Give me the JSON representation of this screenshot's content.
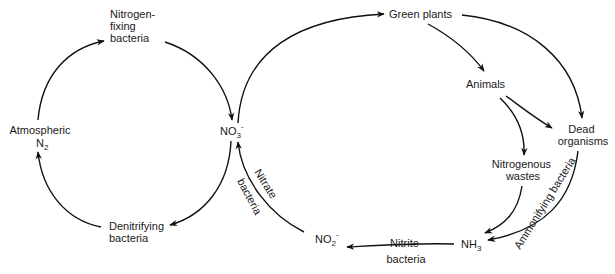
{
  "diagram": {
    "type": "nitrogen-cycle",
    "nodes": {
      "nitrogen_fixing": [
        "Nitrogen-",
        "fixing",
        "bacteria"
      ],
      "atmospheric_n2": {
        "line1": "Atmospheric",
        "line2_main": "N",
        "line2_sub": "2"
      },
      "denitrifying": [
        "Denitrifying",
        "bacteria"
      ],
      "nitrate": {
        "main": "NO",
        "sub": "3",
        "sup": "-"
      },
      "green_plants": "Green plants",
      "animals": "Animals",
      "dead_organisms": [
        "Dead",
        "organisms"
      ],
      "nitrogenous_wastes": [
        "Nitrogenous",
        "wastes"
      ],
      "ammonia": {
        "main": "NH",
        "sub": "3"
      },
      "nitrite": {
        "main": "NO",
        "sub": "2",
        "sup": "-"
      }
    },
    "edge_labels": {
      "nitrate_bacteria": [
        "Nitrate",
        "bacteria"
      ],
      "nitrite_bacteria": [
        "Nitrite",
        "bacteria"
      ],
      "ammonifying_bacteria": "Ammonifying bacteria"
    },
    "edges": [
      {
        "from": "Atmospheric N2",
        "to": "Nitrogen-fixing bacteria"
      },
      {
        "from": "Nitrogen-fixing bacteria",
        "to": "NO3-"
      },
      {
        "from": "NO3-",
        "to": "Denitrifying bacteria"
      },
      {
        "from": "Denitrifying bacteria",
        "to": "Atmospheric N2"
      },
      {
        "from": "NO3-",
        "to": "Green plants"
      },
      {
        "from": "Green plants",
        "to": "Animals"
      },
      {
        "from": "Green plants",
        "to": "Dead organisms"
      },
      {
        "from": "Animals",
        "to": "Dead organisms"
      },
      {
        "from": "Animals",
        "to": "Nitrogenous wastes"
      },
      {
        "from": "Nitrogenous wastes",
        "to": "NH3"
      },
      {
        "from": "Dead organisms",
        "to": "NH3",
        "label": "Ammonifying bacteria"
      },
      {
        "from": "NH3",
        "to": "NO2-",
        "label": "Nitrite bacteria"
      },
      {
        "from": "NO2-",
        "to": "NO3-",
        "label": "Nitrate bacteria"
      }
    ]
  }
}
